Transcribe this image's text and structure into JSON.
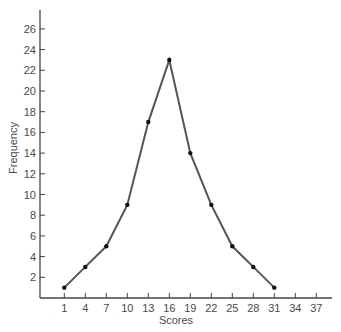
{
  "chart_data": {
    "type": "line",
    "title": "",
    "xlabel": "Scores",
    "ylabel": "Frequency",
    "x": [
      1,
      4,
      7,
      10,
      13,
      16,
      19,
      22,
      25,
      28,
      31
    ],
    "values": [
      1,
      3,
      5,
      9,
      17,
      23,
      14,
      9,
      5,
      3,
      1
    ],
    "series": [
      {
        "name": "Frequency",
        "x": [
          1,
          4,
          7,
          10,
          13,
          16,
          19,
          22,
          25,
          28,
          31
        ],
        "values": [
          1,
          3,
          5,
          9,
          17,
          23,
          14,
          9,
          5,
          3,
          1
        ]
      }
    ],
    "xticks": [
      1,
      4,
      7,
      10,
      13,
      16,
      19,
      22,
      25,
      28,
      31,
      34,
      37
    ],
    "yticks": [
      2,
      4,
      6,
      8,
      10,
      12,
      14,
      16,
      18,
      20,
      22,
      24,
      26
    ],
    "xlim": [
      -4,
      40
    ],
    "ylim": [
      0,
      28
    ],
    "grid": false,
    "legend": "none",
    "markers": true,
    "colors": {
      "line": "#555555",
      "marker": "#111111",
      "axis": "#444444",
      "text": "#4a4a4a"
    }
  }
}
